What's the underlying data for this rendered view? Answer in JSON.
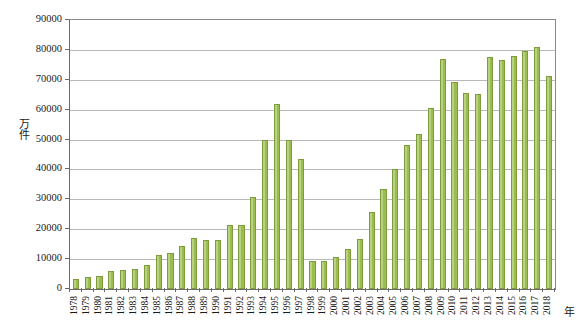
{
  "chart_data": {
    "type": "bar",
    "title": "",
    "subtitle": "",
    "xlabel": "年",
    "ylabel": "万件",
    "ylim": [
      0,
      90000
    ],
    "ytick_step": 10000,
    "yticks": [
      "0",
      "10000",
      "20000",
      "30000",
      "40000",
      "50000",
      "60000",
      "70000",
      "80000",
      "90000"
    ],
    "grid": true,
    "legend": "none",
    "bar_color": "#9ABD4E",
    "bar_border_color": "#7E9B3D",
    "axis_color": "#6B6B6B",
    "gridline_color": "#B9B9B9",
    "categories": [
      "1978",
      "1979",
      "1980",
      "1981",
      "1982",
      "1983",
      "1984",
      "1985",
      "1986",
      "1987",
      "1988",
      "1989",
      "1990",
      "1991",
      "1992",
      "1993",
      "1994",
      "1995",
      "1996",
      "1997",
      "1998",
      "1999",
      "2000",
      "2001",
      "2002",
      "2003",
      "2004",
      "2005",
      "2006",
      "2007",
      "2008",
      "2009",
      "2010",
      "2011",
      "2012",
      "2013",
      "2014",
      "2015",
      "2016",
      "2017",
      "2018"
    ],
    "values": [
      3500,
      3900,
      4200,
      6000,
      6200,
      6700,
      8000,
      11500,
      12000,
      14500,
      17000,
      16500,
      16300,
      21300,
      21500,
      30900,
      50000,
      61800,
      50000,
      43500,
      9500,
      9300,
      10700,
      13400,
      16900,
      25700,
      33600,
      40000,
      48100,
      51800,
      60500,
      76800,
      69200,
      65500,
      65300,
      77700,
      76600,
      78000,
      79600,
      80900,
      71200
    ]
  }
}
